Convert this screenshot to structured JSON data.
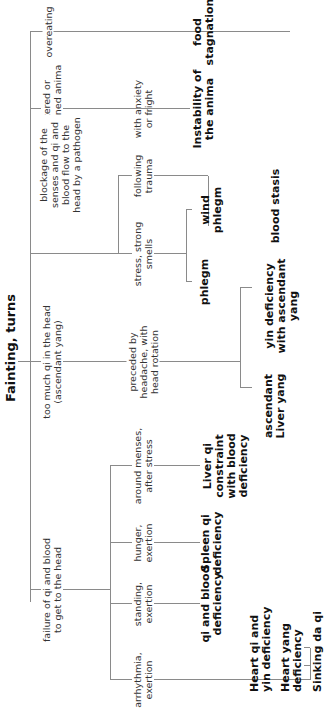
{
  "title": "Fainting, turns",
  "causes": [
    {
      "label": "overeating"
    },
    {
      "label": "scattered or\nconstrained anima"
    },
    {
      "label": "blockage of the\nsenses and qi and\nblood flow to the\nhead by a pathogen"
    },
    {
      "label": "too much qi in the head\n(ascendant yang)"
    },
    {
      "label": "failure of qi and blood\nto get to the head"
    }
  ],
  "triggers": {
    "anxiety": "with anxiety\nor fright",
    "trauma": "following\ntrauma",
    "stress_smells": "stress, strong\nsmells",
    "headache": "preceded by\nheadache, with\nhead rotation",
    "menses": "around menses,\nafter stress",
    "hunger": "hunger,\nexertion",
    "standing": "standing,\nexertion",
    "arrhythmia": "arrhythmia,\nexertion"
  },
  "patterns": {
    "food_stagnation": "food\nstagnation",
    "instability_anima": "Instability of\nthe anima",
    "blood_stasis": "blood stasis",
    "wind_phlegm": "wind\nphlegm",
    "phlegm": "phlegm",
    "yin_def_asc_yang": "yin deficiency\nwith ascendant\nyang",
    "asc_liver_yang": "ascendant\nLiver yang",
    "liver_qi_constraint": "Liver qi\nconstraint\nwith blood\ndeficiency",
    "spleen_qi_def": "Spleen qi\ndeficiency",
    "qi_blood_def": "qi and blood\ndeficiency",
    "heart_qi_yin_def": "Heart qi and\nyin deficiency",
    "heart_yang_def": "Heart yang\ndeficiency",
    "sinking_da_qi": "Sinking da qi"
  },
  "colors": {
    "line": "#8a8a8a",
    "text": "#111111"
  }
}
